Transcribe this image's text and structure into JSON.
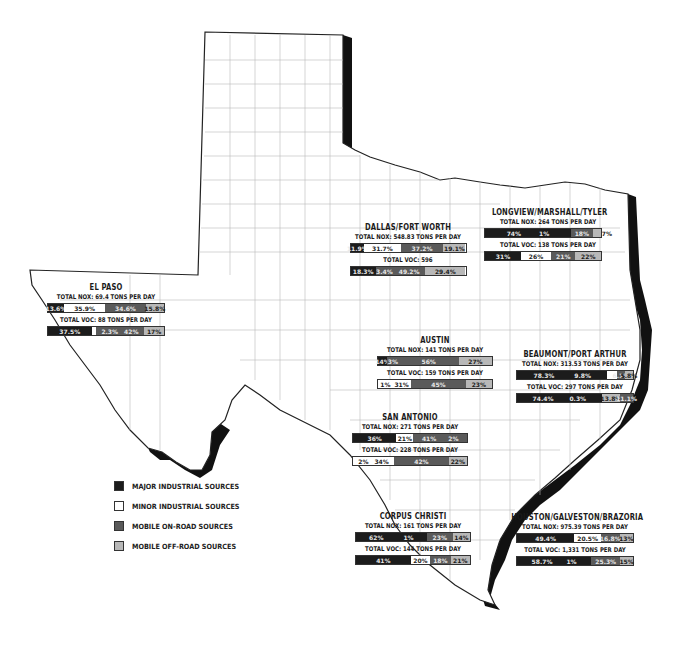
{
  "colors": {
    "major_industrial": "#1c1c1c",
    "minor_industrial": "#ffffff",
    "mobile_on_road": "#5a5a5a",
    "mobile_off_road": "#b8b8b8"
  },
  "legend": {
    "items": [
      {
        "key": "major",
        "label": "MAJOR INDUSTRIAL SOURCES"
      },
      {
        "key": "minor",
        "label": "MINOR INDUSTRIAL SOURCES"
      },
      {
        "key": "onroad",
        "label": "MOBILE ON-ROAD SOURCES"
      },
      {
        "key": "offroad",
        "label": "MOBILE OFF-ROAD SOURCES"
      }
    ]
  },
  "regions": {
    "el_paso": {
      "title": "EL PASO",
      "nox": {
        "label": "TOTAL NOX: 69.4 TONS PER DAY",
        "values": [
          "13.6%",
          "35.9%",
          "34.6%",
          "15.8%"
        ]
      },
      "voc": {
        "label": "TOTAL VOC: 88 TONS PER DAY",
        "values": [
          "37.5%",
          "2.3%",
          "42%",
          "17%"
        ]
      }
    },
    "dallas_fort_worth": {
      "title": "DALLAS/FORT WORTH",
      "nox": {
        "label": "TOTAL NOX: 548.83 TONS PER DAY",
        "values": [
          "11.9%",
          "31.7%",
          "37.2%",
          "19.1%"
        ]
      },
      "voc": {
        "label": "TOTAL VOC: 596",
        "values": [
          "18.3%",
          "3.4%",
          "49.2%",
          "29.4%"
        ]
      }
    },
    "longview_marshall_tyler": {
      "title": "LONGVIEW/MARSHALL/TYLER",
      "nox": {
        "label": "TOTAL NOX: 264 TONS PER DAY",
        "values": [
          "74%",
          "1%",
          "18%",
          "7%"
        ]
      },
      "voc": {
        "label": "TOTAL VOC: 138 TONS PER DAY",
        "values": [
          "31%",
          "26%",
          "21%",
          "22%"
        ]
      }
    },
    "austin": {
      "title": "AUSTIN",
      "nox": {
        "label": "TOTAL NOX: 141 TONS PER DAY",
        "values": [
          "14%",
          "3%",
          "56%",
          "27%"
        ]
      },
      "voc": {
        "label": "TOTAL VOC: 159 TONS PER DAY",
        "values": [
          "1%",
          "31%",
          "45%",
          "23%"
        ]
      }
    },
    "beaumont_port_arthur": {
      "title": "BEAUMONT/PORT ARTHUR",
      "nox": {
        "label": "TOTAL NOX: 313.53 TONS PER DAY",
        "values": [
          "78.3%",
          "9.8%",
          "6.1%",
          "5.8%"
        ]
      },
      "voc": {
        "label": "TOTAL VOC: 297 TONS PER DAY",
        "values": [
          "74.4%",
          "0.3%",
          "13.8%",
          "11.1%"
        ]
      }
    },
    "san_antonio": {
      "title": "SAN ANTONIO",
      "nox": {
        "label": "TOTAL NOX: 271 TONS PER DAY",
        "values": [
          "36%",
          "21%",
          "41%",
          "2%"
        ]
      },
      "voc": {
        "label": "TOTAL VOC: 228 TONS PER DAY",
        "values": [
          "2%",
          "34%",
          "42%",
          "22%"
        ]
      }
    },
    "corpus_christi": {
      "title": "CORPUS CHRISTI",
      "nox": {
        "label": "TOTAL NOX: 161 TONS PER DAY",
        "values": [
          "62%",
          "1%",
          "23%",
          "14%"
        ]
      },
      "voc": {
        "label": "TOTAL VOC: 144 TONS PER DAY",
        "values": [
          "41%",
          "20%",
          "18%",
          "21%"
        ]
      }
    },
    "houston_galveston_brazoria": {
      "title": "HOUSTON/GALVESTON/BRAZORIA",
      "nox": {
        "label": "TOTAL NOX: 975.39 TONS PER DAY",
        "values": [
          "49.4%",
          "20.5%",
          "16.8%",
          "13%"
        ]
      },
      "voc": {
        "label": "TOTAL VOC: 1,331 TONS PER DAY",
        "values": [
          "58.7%",
          "1%",
          "25.3%",
          "15%"
        ]
      }
    }
  }
}
